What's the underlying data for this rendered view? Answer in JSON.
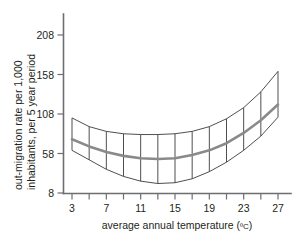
{
  "chart_data": {
    "type": "line",
    "title": "",
    "xlabel": "average annual temperature (ºC)",
    "ylabel_line1": "out-migration rate per 1,000",
    "ylabel_line2": "inhabitants, per 5 year period",
    "xlabel_main": "average annual temperature (",
    "xlabel_unit": "ºC",
    "xlabel_close": ")",
    "x_tick_labels": [
      "3",
      "7",
      "11",
      "15",
      "19",
      "23",
      "27"
    ],
    "x_tick_values": [
      3,
      7,
      11,
      15,
      19,
      23,
      27
    ],
    "x_minor_ticks": [
      3,
      5,
      7,
      9,
      11,
      13,
      15,
      17,
      19,
      21,
      23,
      25,
      27
    ],
    "y_tick_labels": [
      "8",
      "58",
      "108",
      "158",
      "208"
    ],
    "y_tick_values": [
      8,
      58,
      108,
      158,
      208
    ],
    "xlim": [
      2,
      28.5
    ],
    "ylim": [
      -2,
      240
    ],
    "grid": false,
    "legend": "none",
    "series": [
      {
        "name": "fitted out-migration rate",
        "x": [
          3,
          5,
          7,
          9,
          11,
          13,
          15,
          17,
          19,
          21,
          23,
          25,
          27
        ],
        "values": [
          76,
          67,
          60,
          55,
          52,
          51,
          52,
          56,
          62,
          71,
          84,
          100,
          120
        ]
      },
      {
        "name": "upper confidence bound",
        "x": [
          3,
          5,
          7,
          9,
          11,
          13,
          15,
          17,
          19,
          21,
          23,
          25,
          27
        ],
        "values": [
          103,
          92,
          86,
          83,
          82,
          82,
          83,
          86,
          92,
          102,
          116,
          136,
          162
        ]
      },
      {
        "name": "lower confidence bound",
        "x": [
          3,
          5,
          7,
          9,
          11,
          13,
          15,
          17,
          19,
          21,
          23,
          25,
          27
        ],
        "values": [
          62,
          50,
          38,
          29,
          23,
          20,
          21,
          26,
          35,
          47,
          62,
          80,
          104
        ]
      }
    ],
    "colors": {
      "fit_line": "#8a8a8a",
      "band_edge": "#3b3b3b",
      "axis": "#6d6e71",
      "text": "#231f20",
      "background": "#ffffff"
    }
  }
}
